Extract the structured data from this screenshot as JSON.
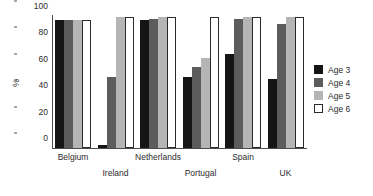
{
  "chart_data": {
    "type": "bar",
    "title": "",
    "xlabel": "",
    "ylabel": "%",
    "ylim": [
      0,
      100
    ],
    "yticks": [
      0,
      20,
      40,
      60,
      80,
      100
    ],
    "grid": false,
    "legend_position": "right",
    "categories": [
      "Belgium",
      "Ireland",
      "Netherlands",
      "Portugal",
      "Spain",
      "UK"
    ],
    "series": [
      {
        "name": "Age 3",
        "color": "#151515",
        "values": [
          97,
          2,
          97,
          54,
          71,
          52
        ]
      },
      {
        "name": "Age 4",
        "color": "#5c5c5c",
        "values": [
          97,
          54,
          98,
          61,
          98,
          94
        ]
      },
      {
        "name": "Age 5",
        "color": "#b5b5b5",
        "values": [
          97,
          99,
          99,
          68,
          99,
          99
        ]
      },
      {
        "name": "Age 6",
        "color": "#ffffff",
        "values": [
          97,
          99,
          99,
          99,
          99,
          99
        ]
      }
    ]
  },
  "axis": {
    "ylabel": "%",
    "tick_0": "0",
    "tick_1": "20",
    "tick_2": "40",
    "tick_3": "60",
    "tick_4": "80",
    "tick_5": "100"
  },
  "categories": {
    "c0": "Belgium",
    "c1": "Ireland",
    "c2": "Netherlands",
    "c3": "Portugal",
    "c4": "Spain",
    "c5": "UK"
  },
  "legend": {
    "items": [
      {
        "label": "Age 3"
      },
      {
        "label": "Age 4"
      },
      {
        "label": "Age 5"
      },
      {
        "label": "Age 6"
      }
    ]
  }
}
